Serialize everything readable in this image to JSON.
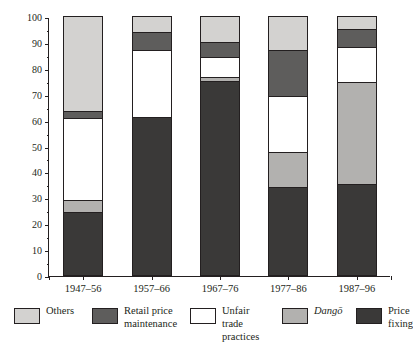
{
  "chart_data": {
    "type": "bar",
    "subtype": "stacked-100-percent",
    "title": "",
    "xlabel": "",
    "ylabel": "Share %",
    "ylim": [
      0,
      100
    ],
    "yticks": [
      0,
      10,
      20,
      30,
      40,
      50,
      60,
      70,
      80,
      90,
      100
    ],
    "grid": false,
    "legend_position": "bottom",
    "categories": [
      "1947–56",
      "1957–66",
      "1967–76",
      "1977–86",
      "1987–96"
    ],
    "series": [
      {
        "name": "Price fixing",
        "values": [
          24.5,
          61.0,
          75.0,
          34.0,
          35.0
        ]
      },
      {
        "name": "Dangō",
        "values": [
          4.5,
          0.0,
          1.5,
          13.5,
          39.5
        ]
      },
      {
        "name": "Unfair trade practices",
        "values": [
          31.5,
          26.0,
          7.5,
          21.5,
          13.5
        ]
      },
      {
        "name": "Retail price maintenance",
        "values": [
          3.0,
          7.0,
          6.0,
          18.0,
          7.0
        ]
      },
      {
        "name": "Others",
        "values": [
          36.5,
          6.0,
          10.0,
          13.0,
          5.0
        ]
      }
    ],
    "stack_order_bottom_to_top": [
      "Price fixing",
      "Dangō",
      "Unfair trade practices",
      "Retail price maintenance",
      "Others"
    ],
    "colors": {
      "Others": "#d3d2d0",
      "Retail price maintenance": "#5e5d5c",
      "Unfair trade practices": "#ffffff",
      "Dangō": "#b2b1af",
      "Price fixing": "#3a3938"
    },
    "legend_entries": [
      {
        "label": "Others",
        "label_lines": "Others",
        "color": "#d3d2d0",
        "italic": false
      },
      {
        "label": "Retail price maintenance",
        "label_lines": "Retail price\nmaintenance",
        "color": "#5e5d5c",
        "italic": false
      },
      {
        "label": "Unfair trade practices",
        "label_lines": "Unfair trade\npractices",
        "color": "#ffffff",
        "italic": false
      },
      {
        "label": "Dangō",
        "label_lines": "Dangō",
        "color": "#b2b1af",
        "italic": true
      },
      {
        "label": "Price fixing",
        "label_lines": "Price\nfixing",
        "color": "#3a3938",
        "italic": false
      }
    ]
  },
  "axis": {
    "y_title": "Share %",
    "y_tick_labels": [
      "0",
      "10",
      "20",
      "30",
      "40",
      "50",
      "60",
      "70",
      "80",
      "90",
      "100"
    ],
    "x_tick_labels": [
      "1947–56",
      "1957–66",
      "1967–76",
      "1977–86",
      "1987–96"
    ]
  }
}
